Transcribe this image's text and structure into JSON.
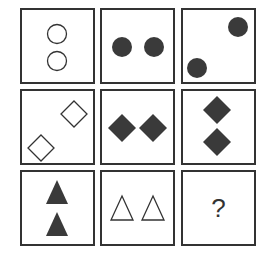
{
  "puzzle": {
    "type": "3x3 matrix reasoning",
    "colors": {
      "border": "#333333",
      "fill": "#3a3a3a",
      "background": "#ffffff"
    },
    "rows": [
      [
        {
          "shape": "circle",
          "count": 2,
          "fill": "hollow",
          "arrangement": "vertical"
        },
        {
          "shape": "circle",
          "count": 2,
          "fill": "solid",
          "arrangement": "horizontal"
        },
        {
          "shape": "circle",
          "count": 2,
          "fill": "solid",
          "arrangement": "diagonal"
        }
      ],
      [
        {
          "shape": "diamond",
          "count": 2,
          "fill": "hollow",
          "arrangement": "diagonal"
        },
        {
          "shape": "diamond",
          "count": 2,
          "fill": "solid",
          "arrangement": "horizontal"
        },
        {
          "shape": "diamond",
          "count": 2,
          "fill": "solid",
          "arrangement": "vertical"
        }
      ],
      [
        {
          "shape": "triangle",
          "count": 2,
          "fill": "solid",
          "arrangement": "vertical"
        },
        {
          "shape": "triangle",
          "count": 2,
          "fill": "hollow",
          "arrangement": "horizontal"
        },
        {
          "shape": "unknown",
          "label": "?"
        }
      ]
    ],
    "missing_label": "?"
  }
}
